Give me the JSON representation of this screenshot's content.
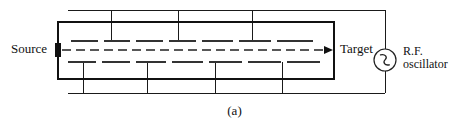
{
  "figure": {
    "caption": "(a)",
    "labels": {
      "source": "Source",
      "target": "Target",
      "rf_line1": "R.F.",
      "rf_line2": "oscillator"
    },
    "icons": {
      "oscillator": "ac-source-icon",
      "beam": "beam-arrow-icon",
      "aperture": "source-aperture-icon"
    },
    "colors": {
      "ink": "#111111",
      "line": "#1a1a1a",
      "background": "#ffffff"
    }
  },
  "diagram_data": {
    "type": "schematic",
    "subject": "linear accelerator with drift tubes driven by an R.F. oscillator",
    "chamber": {
      "x": 57,
      "y": 21,
      "width": 276,
      "height": 57
    },
    "beam_axis_y": 50,
    "beam_start_x": 63,
    "beam_end_x": 333,
    "aperture": {
      "x": 55,
      "y": 43,
      "width": 6,
      "height": 14
    },
    "upper_tubes": [
      {
        "x1": 71,
        "x2": 98
      },
      {
        "x1": 104,
        "x2": 130
      },
      {
        "x1": 136,
        "x2": 163
      },
      {
        "x1": 169,
        "x2": 196
      },
      {
        "x1": 202,
        "x2": 233
      },
      {
        "x1": 239,
        "x2": 271
      },
      {
        "x1": 277,
        "x2": 313
      }
    ],
    "lower_tubes": [
      {
        "x1": 68,
        "x2": 96
      },
      {
        "x1": 102,
        "x2": 130
      },
      {
        "x1": 136,
        "x2": 166
      },
      {
        "x1": 172,
        "x2": 203
      },
      {
        "x1": 209,
        "x2": 242
      },
      {
        "x1": 248,
        "x2": 281
      },
      {
        "x1": 287,
        "x2": 320
      }
    ],
    "upper_tube_y": 41,
    "lower_tube_y": 62,
    "upper_stem_x": [
      111,
      178,
      252
    ],
    "lower_stem_x": [
      83,
      147,
      215,
      282
    ],
    "top_bus": {
      "y": 10,
      "x1": 68,
      "x2": 400
    },
    "bottom_bus": {
      "y": 93,
      "x1": 68,
      "x2": 400
    },
    "oscillator": {
      "cx": 385,
      "cy": 60,
      "r": 11
    },
    "oscillator_line_x": 385
  }
}
